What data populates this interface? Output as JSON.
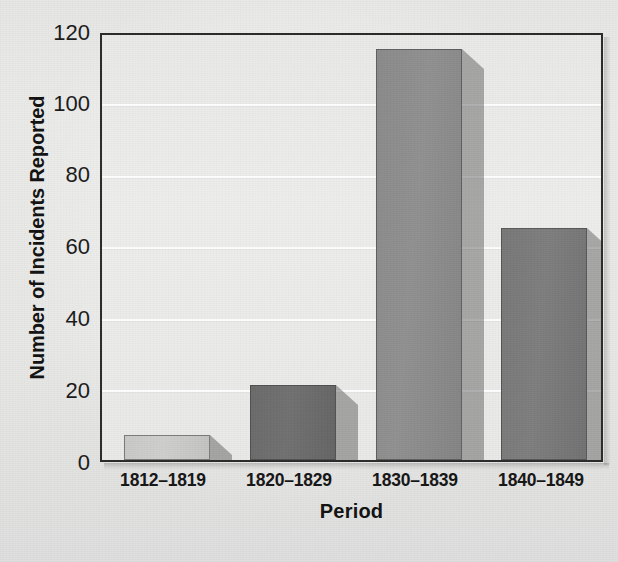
{
  "chart_data": {
    "type": "bar",
    "title": "",
    "categories": [
      "1812–1819",
      "1820–1829",
      "1830–1839",
      "1840–1849"
    ],
    "values": [
      7,
      21,
      115,
      65
    ],
    "series": [
      {
        "name": "Number of Incidents Reported",
        "values": [
          7,
          21,
          115,
          65
        ]
      }
    ],
    "xlabel": "Period",
    "ylabel": "Number of Incidents Reported",
    "ylim": [
      0,
      120
    ],
    "yticks": [
      0,
      20,
      40,
      60,
      80,
      100,
      120
    ],
    "ytick_labels": [
      "0",
      "20",
      "40",
      "60",
      "80",
      "100",
      "120"
    ],
    "grid": "horizontal-white-gridlines",
    "legend": "none",
    "bar_colors": [
      "#c9c9c7",
      "#6b6b6b",
      "#8a8a8a",
      "#787878"
    ],
    "style": "grayscale-scanned-3d-bars",
    "axis_color": "#2a2a2a",
    "plot_background": "#eaeae8",
    "page_background": "#e8e8e6"
  },
  "axes": {
    "y_title": "Number of Incidents Reported",
    "x_title": "Period"
  }
}
